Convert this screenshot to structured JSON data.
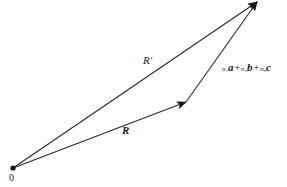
{
  "diagram": {
    "type": "vector-addition",
    "points": {
      "origin": {
        "x": 13,
        "y": 168,
        "label": "0"
      },
      "mid": {
        "x": 186,
        "y": 102
      },
      "tip": {
        "x": 257,
        "y": 2
      }
    },
    "vectors": [
      {
        "name": "R",
        "from": "origin",
        "to": "mid",
        "label": "R"
      },
      {
        "name": "translation",
        "from": "mid",
        "to": "tip",
        "label": "n₁a + n₂b + n₃c"
      },
      {
        "name": "R-prime",
        "from": "origin",
        "to": "tip",
        "label": "R′"
      }
    ],
    "labels": {
      "origin": "0",
      "r_prime": "R′",
      "r": "R",
      "sum": {
        "terms": [
          {
            "coef": "n₁",
            "vec": "a"
          },
          {
            "coef": "n₂",
            "vec": "b"
          },
          {
            "coef": "n₃",
            "vec": "c"
          }
        ],
        "operator": "+"
      }
    },
    "colors": {
      "line": "#2a2a2a",
      "text": "#1a1a1a",
      "background": "#ffffff"
    }
  }
}
